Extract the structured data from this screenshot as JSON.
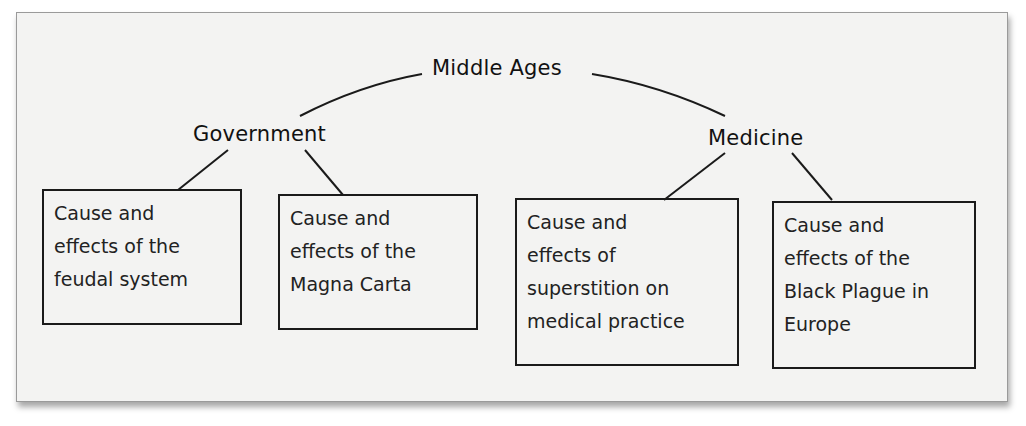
{
  "diagram": {
    "root": {
      "label": "Middle Ages"
    },
    "branches": [
      {
        "label": "Government",
        "children": [
          {
            "lines": [
              "Cause and",
              "effects of the",
              "feudal system"
            ]
          },
          {
            "lines": [
              "Cause and",
              "effects of the",
              "Magna Carta"
            ]
          }
        ]
      },
      {
        "label": "Medicine",
        "children": [
          {
            "lines": [
              "Cause and",
              "effects of",
              "superstition on",
              "medical practice"
            ]
          },
          {
            "lines": [
              "Cause and",
              "effects of the",
              "Black Plague in",
              "Europe"
            ]
          }
        ]
      }
    ]
  },
  "colors": {
    "background": "#f3f3f2",
    "stroke": "#1a1a1a",
    "text": "#222222"
  }
}
